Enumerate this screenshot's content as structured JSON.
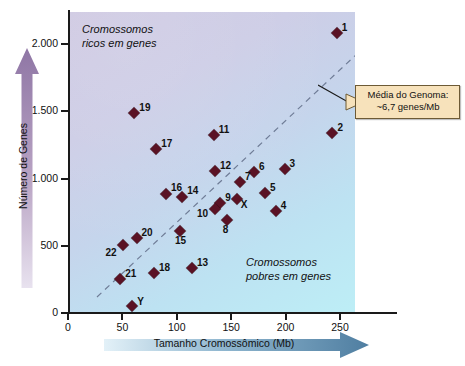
{
  "chart_data": {
    "type": "scatter",
    "title": "",
    "xlabel": "Tamanho Cromossômico (Mb)",
    "ylabel": "Número de Genes",
    "xlim": [
      0,
      285
    ],
    "ylim": [
      0,
      2250
    ],
    "xticks": [
      0,
      50,
      100,
      150,
      200,
      250
    ],
    "xtick_labels": [
      "0",
      "50",
      "100",
      "150",
      "200",
      "250"
    ],
    "yticks": [
      0,
      500,
      1000,
      1500,
      2000
    ],
    "ytick_labels": [
      "0",
      "500",
      "1.000",
      "1.500",
      "2.000"
    ],
    "grid": false,
    "legend": null,
    "points": [
      {
        "label": "1",
        "x": 247,
        "y": 2080
      },
      {
        "label": "2",
        "x": 243,
        "y": 1340
      },
      {
        "label": "3",
        "x": 199,
        "y": 1070
      },
      {
        "label": "4",
        "x": 191,
        "y": 755
      },
      {
        "label": "5",
        "x": 181,
        "y": 890
      },
      {
        "label": "6",
        "x": 171,
        "y": 1045
      },
      {
        "label": "7",
        "x": 158,
        "y": 975
      },
      {
        "label": "8",
        "x": 146,
        "y": 690
      },
      {
        "label": "9",
        "x": 140,
        "y": 815
      },
      {
        "label": "10",
        "x": 135,
        "y": 770
      },
      {
        "label": "11",
        "x": 134,
        "y": 1325
      },
      {
        "label": "12",
        "x": 135,
        "y": 1055
      },
      {
        "label": "13",
        "x": 114,
        "y": 335
      },
      {
        "label": "14",
        "x": 105,
        "y": 865
      },
      {
        "label": "15",
        "x": 103,
        "y": 610
      },
      {
        "label": "16",
        "x": 90,
        "y": 885
      },
      {
        "label": "17",
        "x": 81,
        "y": 1220
      },
      {
        "label": "18",
        "x": 79,
        "y": 295
      },
      {
        "label": "19",
        "x": 61,
        "y": 1490
      },
      {
        "label": "20",
        "x": 63,
        "y": 555
      },
      {
        "label": "21",
        "x": 48,
        "y": 250
      },
      {
        "label": "22",
        "x": 51,
        "y": 505
      },
      {
        "label": "X",
        "x": 155,
        "y": 845
      },
      {
        "label": "Y",
        "x": 59,
        "y": 50
      }
    ],
    "trendline": {
      "label": "Média do Genoma: ~6,7 genes/Mb",
      "slope_genes_per_mb": 6.7,
      "x_start": 25,
      "x_end": 268
    },
    "annotations": [
      {
        "name": "zone-gene-rich",
        "text": "Cromossomos\nricos em genes"
      },
      {
        "name": "zone-gene-poor",
        "text": "Cromossomos\npobres em genes"
      }
    ]
  },
  "callout": {
    "line1": "Média do Genoma:",
    "line2": "~6,7 genes/Mb",
    "bg_color": "#f7e2bb",
    "border_color": "#6d5a35"
  },
  "axes": {
    "x_title": "Tamanho Cromossômico (Mb)",
    "y_title": "Número de Genes",
    "x_arrow_color": "#5b87ab",
    "y_arrow_color": "#9b86ad"
  },
  "zones": {
    "rich": "Cromossomos\nricos em genes",
    "poor": "Cromossomos\npobres em genes"
  },
  "marker_color": "#5a1224"
}
